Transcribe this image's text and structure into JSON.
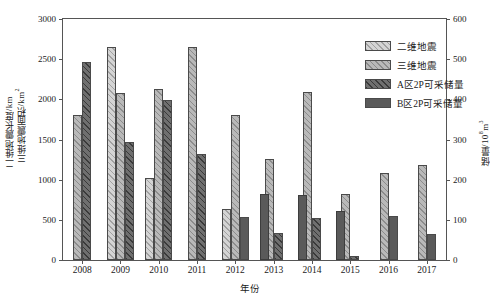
{
  "chart_data": {
    "type": "bar",
    "title": "",
    "xlabel": "年份",
    "ylabel_left_1": "二维地震长度/km",
    "ylabel_left_2": "三维地震面积/km",
    "ylabel_left_2_sup": "2",
    "ylabel_right": "储量/10",
    "ylabel_right_sup": "8",
    "ylabel_right_tail": "m",
    "ylabel_right_tail_sup": "3",
    "categories": [
      "2008",
      "2009",
      "2010",
      "2011",
      "2012",
      "2013",
      "2014",
      "2015",
      "2016",
      "2017"
    ],
    "ylim_left": [
      0,
      3000
    ],
    "yticks_left": [
      0,
      500,
      1000,
      1500,
      2000,
      2500,
      3000
    ],
    "ylim_right": [
      0,
      600
    ],
    "yticks_right": [
      0,
      100,
      200,
      300,
      400,
      500,
      600
    ],
    "grid": false,
    "legend_position": "top-right",
    "series": [
      {
        "name": "二维地震",
        "axis": "left",
        "unit": "km",
        "color": "#d4d4d4",
        "values": [
          null,
          2655,
          1015,
          null,
          640,
          null,
          null,
          null,
          null,
          null
        ]
      },
      {
        "name": "三维地震",
        "axis": "left",
        "unit": "km2",
        "color": "#b9b9b9",
        "values": [
          1810,
          2085,
          2125,
          2655,
          1805,
          1255,
          2090,
          825,
          1085,
          1180
        ]
      },
      {
        "name": "A区2P可采储量",
        "axis": "right",
        "unit": "10^8 m3",
        "color": "#6f6f6f",
        "values": [
          494,
          294,
          399,
          264,
          null,
          68,
          104,
          9,
          null,
          null
        ]
      },
      {
        "name": "B区2P可采储量",
        "axis": "right",
        "unit": "10^8 m3",
        "color": "#5a5a5a",
        "values": [
          null,
          null,
          null,
          null,
          107,
          164,
          163,
          123,
          109,
          64
        ]
      }
    ]
  },
  "legend": {
    "items": [
      {
        "label": "二维地震",
        "pattern": "hatch-light"
      },
      {
        "label": "三维地震",
        "pattern": "hatch-medium"
      },
      {
        "label": "A区2P可采储量",
        "pattern": "hatch-dark"
      },
      {
        "label": "B区2P可采储量",
        "pattern": "solid-dark"
      }
    ]
  }
}
